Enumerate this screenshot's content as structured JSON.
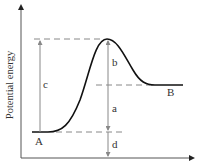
{
  "diagram": {
    "ylabel": "Potential energy",
    "xlabel": "",
    "points": {
      "A": "A",
      "B": "B"
    },
    "intervals": {
      "a": "a",
      "b": "b",
      "c": "c",
      "d": "d"
    },
    "colors": {
      "curve": "#111111",
      "axis": "#555555",
      "dashed": "#888888",
      "arrow": "#888888"
    }
  }
}
